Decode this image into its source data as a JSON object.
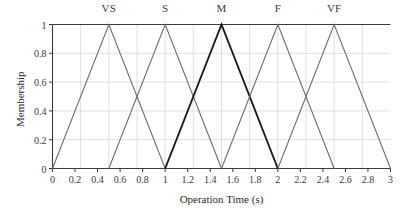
{
  "chart_data": {
    "type": "line",
    "title": "",
    "xlabel": "Operation Time (s)",
    "ylabel": "Membership",
    "xlim": [
      0,
      3
    ],
    "ylim": [
      0,
      1
    ],
    "xticks": [
      "0",
      "0.2",
      "0.4",
      "0.6",
      "0.8",
      "1",
      "1.2",
      "1.4",
      "1.6",
      "1.8",
      "2",
      "2.2",
      "2.4",
      "2.6",
      "2.8",
      "3"
    ],
    "xtick_values": [
      0,
      0.2,
      0.4,
      0.6,
      0.8,
      1.0,
      1.2,
      1.4,
      1.6,
      1.8,
      2.0,
      2.2,
      2.4,
      2.6,
      2.8,
      3.0
    ],
    "yticks": [
      "0",
      "0.2",
      "0.4",
      "0.6",
      "0.8",
      "1"
    ],
    "ytick_values": [
      0,
      0.2,
      0.4,
      0.6,
      0.8,
      1.0
    ],
    "grid": true,
    "grid_x_step": 0.25,
    "grid_y_step": 0.2,
    "legend_position": "above-peaks",
    "series": [
      {
        "name": "VS",
        "label": "VS",
        "peak_x": 0.5,
        "color": "#6e6e6e",
        "width": 1.1,
        "x": [
          0,
          0.5,
          1.0
        ],
        "values": [
          0,
          1,
          0
        ]
      },
      {
        "name": "S",
        "label": "S",
        "peak_x": 1.0,
        "color": "#6e6e6e",
        "width": 1.1,
        "x": [
          0.5,
          1.0,
          1.5
        ],
        "values": [
          0,
          1,
          0
        ]
      },
      {
        "name": "M",
        "label": "M",
        "peak_x": 1.5,
        "color": "#1a1a1a",
        "width": 1.9,
        "x": [
          1.0,
          1.5,
          2.0
        ],
        "values": [
          0,
          1,
          0
        ]
      },
      {
        "name": "F",
        "label": "F",
        "peak_x": 2.0,
        "color": "#6e6e6e",
        "width": 1.1,
        "x": [
          1.5,
          2.0,
          2.5
        ],
        "values": [
          0,
          1,
          0
        ]
      },
      {
        "name": "VF",
        "label": "VF",
        "peak_x": 2.5,
        "color": "#6e6e6e",
        "width": 1.1,
        "x": [
          2.0,
          2.5,
          3.0
        ],
        "values": [
          0,
          1,
          0
        ]
      }
    ],
    "colors": {
      "axis": "#3a3a3a",
      "grid": "#d8d8d8",
      "normal_series": "#6e6e6e",
      "highlight_series": "#1a1a1a",
      "background": "#ffffff"
    }
  }
}
